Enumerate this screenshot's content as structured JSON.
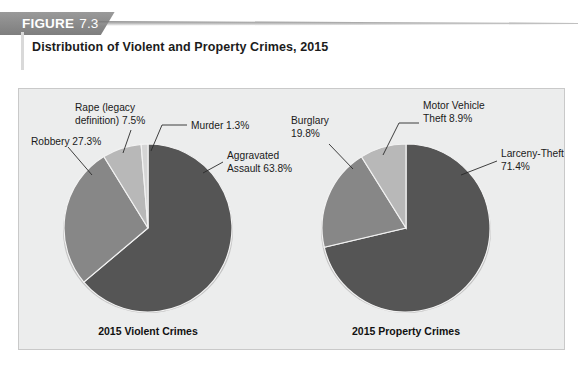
{
  "header": {
    "tag_word": "FIGURE",
    "tag_number": "7.3",
    "title": "Distribution of Violent and Property Crimes, 2015"
  },
  "colors": {
    "panel_background": "#eceded",
    "panel_border": "#c9c9c9",
    "tag_background": "#8d8d8d",
    "slice_dark": "#555555",
    "slice_medium": "#878787",
    "slice_light": "#b8b8b8",
    "slice_sliver": "#d5d5d5",
    "slice_edge": "#f2f2f2",
    "leader_line": "#2a2a2a",
    "text": "#1a1a1a"
  },
  "chart_data": [
    {
      "type": "pie",
      "title": "2015 Violent Crimes",
      "caption": "2015 Violent Crimes",
      "categories": [
        "Aggravated Assault",
        "Robbery",
        "Rape (legacy definition)",
        "Murder"
      ],
      "values": [
        63.8,
        27.3,
        7.5,
        1.3
      ],
      "unit": "percent",
      "start_angle_deg": -90,
      "direction": "clockwise",
      "labels": [
        {
          "name": "Aggravated Assault",
          "text_line1": "Aggravated",
          "text_line2": "Assault 63.8%",
          "value": 63.8
        },
        {
          "name": "Robbery",
          "text_line1": "Robbery 27.3%",
          "text_line2": "",
          "value": 27.3
        },
        {
          "name": "Rape (legacy definition)",
          "text_line1": "Rape (legacy",
          "text_line2": "definition) 7.5%",
          "value": 7.5
        },
        {
          "name": "Murder",
          "text_line1": "Murder 1.3%",
          "text_line2": "",
          "value": 1.3
        }
      ]
    },
    {
      "type": "pie",
      "title": "2015 Property Crimes",
      "caption": "2015 Property Crimes",
      "categories": [
        "Larceny-Theft",
        "Burglary",
        "Motor Vehicle Theft"
      ],
      "values": [
        71.4,
        19.8,
        8.9
      ],
      "unit": "percent",
      "start_angle_deg": -90,
      "direction": "clockwise",
      "labels": [
        {
          "name": "Larceny-Theft",
          "text_line1": "Larceny-Theft",
          "text_line2": "71.4%",
          "value": 71.4
        },
        {
          "name": "Burglary",
          "text_line1": "Burglary",
          "text_line2": "19.8%",
          "value": 19.8
        },
        {
          "name": "Motor Vehicle Theft",
          "text_line1": "Motor Vehicle",
          "text_line2": "Theft 8.9%",
          "value": 8.9
        }
      ]
    }
  ],
  "pie_left": {
    "caption": "2015 Violent Crimes",
    "label_aggravated_l1": "Aggravated",
    "label_aggravated_l2": "Assault 63.8%",
    "label_robbery": "Robbery 27.3%",
    "label_rape_l1": "Rape (legacy",
    "label_rape_l2": "definition) 7.5%",
    "label_murder": "Murder 1.3%"
  },
  "pie_right": {
    "caption": "2015 Property Crimes",
    "label_larceny_l1": "Larceny-Theft",
    "label_larceny_l2": "71.4%",
    "label_burglary_l1": "Burglary",
    "label_burglary_l2": "19.8%",
    "label_mvt_l1": "Motor Vehicle",
    "label_mvt_l2": "Theft 8.9%"
  }
}
